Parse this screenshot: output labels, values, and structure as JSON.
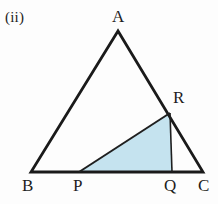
{
  "figure": {
    "part_label": "(ii)",
    "canvas": {
      "width": 218,
      "height": 204,
      "background": "#fdfdfd"
    },
    "styles": {
      "outline_color": "#1a1a1a",
      "outline_width": 2.8,
      "inner_line_color": "#1f1f1f",
      "inner_line_width": 2.0,
      "cevian_line_width": 1.6,
      "shade_fill": "#c5e3ef",
      "label_color": "#1d1d1d"
    },
    "points": {
      "A": {
        "label": "A",
        "x": 118,
        "y": 31,
        "label_x": 112,
        "label_y": 8
      },
      "B": {
        "label": "B",
        "x": 31,
        "y": 172,
        "label_x": 22,
        "label_y": 177
      },
      "C": {
        "label": "C",
        "x": 203,
        "y": 172,
        "label_x": 198,
        "label_y": 177
      },
      "P": {
        "label": "P",
        "x": 79,
        "y": 172,
        "label_x": 73,
        "label_y": 177
      },
      "Q": {
        "label": "Q",
        "x": 172,
        "y": 172,
        "label_x": 164,
        "label_y": 177
      },
      "R": {
        "label": "R",
        "x": 170,
        "y": 113,
        "label_x": 173,
        "label_y": 89
      }
    },
    "shapes": {
      "main_triangle": "118,31 31,172 203,172",
      "shaded_triangle": "79,172 170,113 172,172"
    },
    "segments": {
      "side_AB": {
        "x1": 118,
        "y1": 31,
        "x2": 31,
        "y2": 172
      },
      "side_AC": {
        "x1": 118,
        "y1": 31,
        "x2": 203,
        "y2": 172
      },
      "side_BC": {
        "x1": 31,
        "y1": 172,
        "x2": 203,
        "y2": 172
      },
      "segment_PR": {
        "x1": 79,
        "y1": 172,
        "x2": 170,
        "y2": 113
      },
      "segment_RQ": {
        "x1": 170,
        "y1": 113,
        "x2": 172,
        "y2": 172
      },
      "segment_PQ": {
        "x1": 79,
        "y1": 172,
        "x2": 172,
        "y2": 172
      }
    }
  }
}
